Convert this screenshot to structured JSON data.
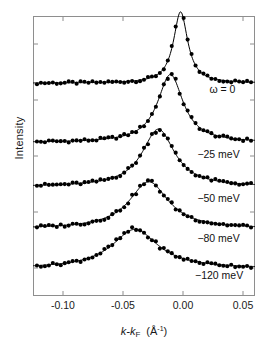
{
  "figure": {
    "y_axis_label": "Intensity",
    "x_axis_label_main": "k-k",
    "x_axis_label_sub": "F",
    "x_axis_label_unit_open": "(Å",
    "x_axis_label_unit_sup": "-1",
    "x_axis_label_unit_close": ")"
  },
  "xticks": [
    {
      "label": "-0.10",
      "value": -0.1
    },
    {
      "label": "-0.05",
      "value": -0.05
    },
    {
      "label": "0.00",
      "value": 0.0
    },
    {
      "label": "0.05",
      "value": 0.05
    }
  ],
  "curve_labels": [
    {
      "text": "ω = 0"
    },
    {
      "text": "−25 meV"
    },
    {
      "text": "−50 meV"
    },
    {
      "text": "−80 meV"
    },
    {
      "text": "−120 meV"
    }
  ],
  "chart_data": {
    "type": "line",
    "title": "",
    "subtitle": "",
    "xlabel": "k-k_F (Å^-1)",
    "ylabel": "Intensity",
    "xlim": [
      -0.125,
      0.06
    ],
    "ylim": [
      0,
      1
    ],
    "grid": false,
    "legend_position": "inline-right",
    "xticks": [
      -0.1,
      -0.05,
      0.0,
      0.05
    ],
    "yticks_count": 5,
    "series": [
      {
        "name": "ω = 0",
        "energy_meV": 0,
        "peak_x": -0.002,
        "hwhm": 0.0072,
        "amplitude": 0.255,
        "baseline": 0.76,
        "label_x": 0.022,
        "label_y": 0.735,
        "marker": "filled-circle",
        "fit": "lorentzian"
      },
      {
        "name": "−25 meV",
        "energy_meV": -25,
        "peak_x": -0.0105,
        "hwhm": 0.013,
        "amplitude": 0.243,
        "baseline": 0.548,
        "label_x": 0.012,
        "label_y": 0.505,
        "marker": "filled-circle",
        "fit": "lorentzian"
      },
      {
        "name": "−50 meV",
        "energy_meV": -50,
        "peak_x": -0.0205,
        "hwhm": 0.0165,
        "amplitude": 0.206,
        "baseline": 0.39,
        "label_x": 0.012,
        "label_y": 0.348,
        "marker": "filled-circle",
        "fit": "lorentzian"
      },
      {
        "name": "−80 meV",
        "energy_meV": -80,
        "peak_x": -0.0285,
        "hwhm": 0.02,
        "amplitude": 0.168,
        "baseline": 0.24,
        "label_x": 0.012,
        "label_y": 0.204,
        "marker": "filled-circle",
        "fit": "lorentzian"
      },
      {
        "name": "−120 meV",
        "energy_meV": -120,
        "peak_x": -0.04,
        "hwhm": 0.0235,
        "amplitude": 0.14,
        "baseline": 0.098,
        "label_x": 0.01,
        "label_y": 0.072,
        "marker": "filled-circle",
        "fit": "lorentzian"
      }
    ]
  },
  "colors": {
    "frame": "#8e8e8e",
    "curve": "#000000",
    "marker": "#000000",
    "text": "#1a1a1a",
    "background": "#ffffff"
  }
}
